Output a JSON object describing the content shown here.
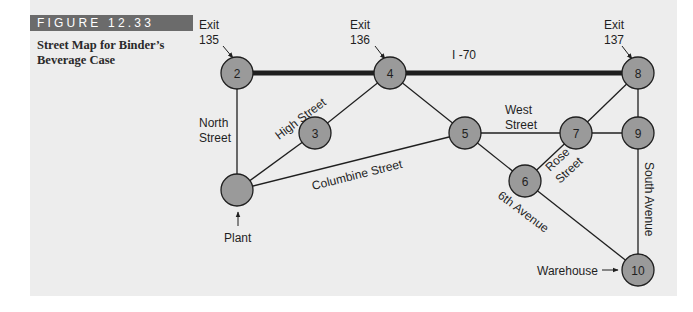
{
  "figure": {
    "tag": "FIGURE 12.33",
    "caption": "Street Map for Binder’s Beverage Case"
  },
  "colors": {
    "panel_bg": "#ededed",
    "node_fill": "#9a9a9a",
    "tag_bg": "#6b6b6b",
    "line": "#1f1f1f"
  },
  "nodes": [
    {
      "id": "1",
      "label": "",
      "x": 237,
      "y": 190
    },
    {
      "id": "2",
      "label": "2",
      "x": 237,
      "y": 73
    },
    {
      "id": "3",
      "label": "3",
      "x": 315,
      "y": 133
    },
    {
      "id": "4",
      "label": "4",
      "x": 390,
      "y": 73
    },
    {
      "id": "5",
      "label": "5",
      "x": 465,
      "y": 133
    },
    {
      "id": "6",
      "label": "6",
      "x": 525,
      "y": 181
    },
    {
      "id": "7",
      "label": "7",
      "x": 576,
      "y": 133
    },
    {
      "id": "8",
      "label": "8",
      "x": 638,
      "y": 73
    },
    {
      "id": "9",
      "label": "9",
      "x": 638,
      "y": 133
    },
    {
      "id": "10",
      "label": "10",
      "x": 638,
      "y": 270
    }
  ],
  "edges": [
    {
      "from": "2",
      "to": "4",
      "street": "I-70",
      "highway": true
    },
    {
      "from": "4",
      "to": "8",
      "street": "I-70",
      "highway": true
    },
    {
      "from": "2",
      "to": "1",
      "street": "North Street"
    },
    {
      "from": "1",
      "to": "3",
      "street": "High Street"
    },
    {
      "from": "3",
      "to": "4",
      "street": "High Street"
    },
    {
      "from": "4",
      "to": "5",
      "street": ""
    },
    {
      "from": "1",
      "to": "5",
      "street": "Columbine Street"
    },
    {
      "from": "5",
      "to": "7",
      "street": "West Street"
    },
    {
      "from": "7",
      "to": "9",
      "street": ""
    },
    {
      "from": "5",
      "to": "6",
      "street": "6th Avenue"
    },
    {
      "from": "6",
      "to": "7",
      "street": "Rose Street"
    },
    {
      "from": "7",
      "to": "8",
      "street": ""
    },
    {
      "from": "8",
      "to": "9",
      "street": ""
    },
    {
      "from": "9",
      "to": "10",
      "street": "South Avenue"
    },
    {
      "from": "6",
      "to": "10",
      "street": "6th Avenue"
    }
  ],
  "labels": {
    "exit_135_line1": "Exit",
    "exit_135_line2": "135",
    "exit_136_line1": "Exit",
    "exit_136_line2": "136",
    "exit_137_line1": "Exit",
    "exit_137_line2": "137",
    "highway": "I -70",
    "north_street_line1": "North",
    "north_street_line2": "Street",
    "high_street": "High Street",
    "columbine_street": "Columbine Street",
    "west_street_line1": "West",
    "west_street_line2": "Street",
    "rose_street_line1": "Rose",
    "rose_street_line2": "Street",
    "sixth_avenue": "6th Avenue",
    "south_avenue": "South Avenue",
    "plant": "Plant",
    "warehouse": "Warehouse"
  }
}
